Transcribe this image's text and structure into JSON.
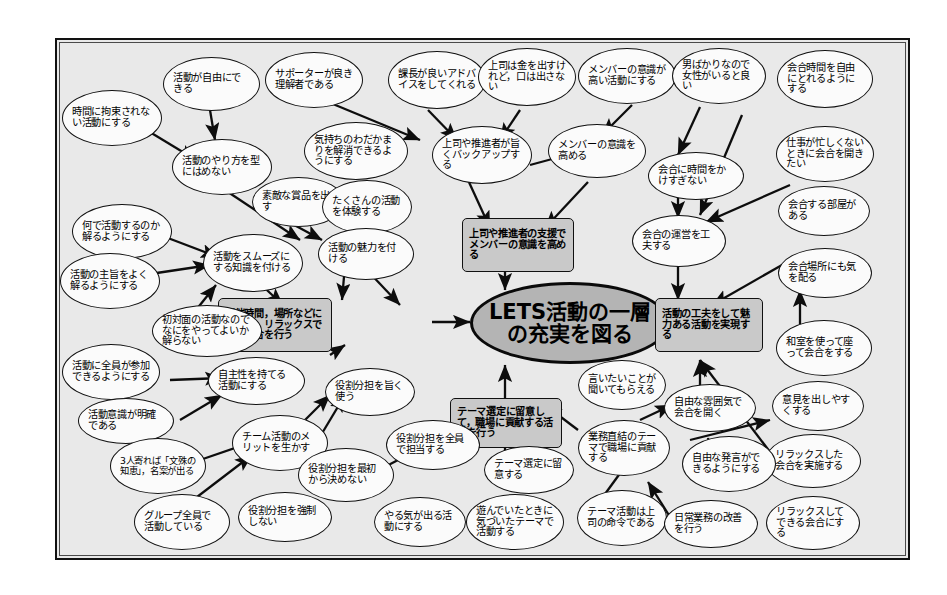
{
  "diagram": {
    "type": "relations-diagram",
    "title_node": "LETS活動の一層の充実を図る",
    "central": {
      "label": "LETS活動の一層の充実を図る"
    },
    "mid_boxes": [
      {
        "id": "b1",
        "label": "上司や推進者の支援でメンバーの意識を高める"
      },
      {
        "id": "b2",
        "label": "活動の工夫をして魅力ある活動を実現する"
      },
      {
        "id": "b3",
        "label": "開催時間，場所などに配慮し，リラックスできる会合を行う"
      },
      {
        "id": "b4",
        "label": "テーマ選定に留意して，職場に貢献する活動を行う"
      }
    ],
    "nodes": [
      {
        "id": "n01",
        "label": "活動が自由にできる"
      },
      {
        "id": "n02",
        "label": "時間に拘束されない活動にする"
      },
      {
        "id": "n03",
        "label": "活動のやり方を型にはめない"
      },
      {
        "id": "n04",
        "label": "何で活動するのか解るようにする"
      },
      {
        "id": "n05",
        "label": "活動の主旨をよく解るようにする"
      },
      {
        "id": "n06",
        "label": "活動をスムーズにする知識を付ける"
      },
      {
        "id": "n07",
        "label": "サポーターが良き理解者である"
      },
      {
        "id": "n08",
        "label": "気持ちのわだかまりを解消できるようにする"
      },
      {
        "id": "n09",
        "label": "素敵な賞品を出す"
      },
      {
        "id": "n10",
        "label": "たくさんの活動を体験する"
      },
      {
        "id": "n11",
        "label": "活動の魅力を付ける"
      },
      {
        "id": "n12",
        "label": "課長が良いアドバイスをしてくれる"
      },
      {
        "id": "n13",
        "label": "上司は金を出すけれど，口は出さない"
      },
      {
        "id": "n14",
        "label": "上司や推進者が旨くバックアップする"
      },
      {
        "id": "n15",
        "label": "メンバーの意識が高い活動にする"
      },
      {
        "id": "n16",
        "label": "メンバーの意識を高める"
      },
      {
        "id": "n17",
        "label": "男ばかりなので女性がいると良い"
      },
      {
        "id": "n18",
        "label": "会合時間を自由にとれるようにする"
      },
      {
        "id": "n19",
        "label": "仕事が忙しくないときに会合を開きたい"
      },
      {
        "id": "n20",
        "label": "会合に時間をかけすぎない"
      },
      {
        "id": "n21",
        "label": "会合する部屋がある"
      },
      {
        "id": "n22",
        "label": "会合の運営を工夫する"
      },
      {
        "id": "n23",
        "label": "会合場所にも気を配る"
      },
      {
        "id": "n24",
        "label": "和室を使って座って会合をする"
      },
      {
        "id": "n25",
        "label": "意見を出しやすくする"
      },
      {
        "id": "n26",
        "label": "リラックスした会合を実施する"
      },
      {
        "id": "n27",
        "label": "リラックスしてできる会合にする"
      },
      {
        "id": "n28",
        "label": "初対面の活動なのでなにをやってよいか解らない"
      },
      {
        "id": "n29",
        "label": "活動に全員が参加できるようにする"
      },
      {
        "id": "n30",
        "label": "自主性を持てる活動にする"
      },
      {
        "id": "n31",
        "label": "活動意識が明確である"
      },
      {
        "id": "n32",
        "label": "3人寄れば「文殊の知恵」，名案が出る"
      },
      {
        "id": "n33",
        "label": "チーム活動のメリットを生かす"
      },
      {
        "id": "n34",
        "label": "グループ全員で活動している"
      },
      {
        "id": "n35",
        "label": "役割分担を強制しない"
      },
      {
        "id": "n36",
        "label": "役割分担を最初から決めない"
      },
      {
        "id": "n37",
        "label": "役割分担を旨く使う"
      },
      {
        "id": "n38",
        "label": "役割分担を全員で担当する"
      },
      {
        "id": "n39",
        "label": "やる気が出る活動にする"
      },
      {
        "id": "n40",
        "label": "テーマ選定に留意する"
      },
      {
        "id": "n41",
        "label": "遊んでいたときに気づいたテーマで活動する"
      },
      {
        "id": "n42",
        "label": "テーマ活動は上司の命令である"
      },
      {
        "id": "n43",
        "label": "業務直結のテーマで職場に貢献する"
      },
      {
        "id": "n44",
        "label": "日常業務の改善を行う"
      },
      {
        "id": "n45",
        "label": "自由な発言ができるようにする"
      },
      {
        "id": "n46",
        "label": "自由な雰囲気で会合を開く"
      },
      {
        "id": "n47",
        "label": "言いたいことが聞いてもらえる"
      }
    ]
  }
}
